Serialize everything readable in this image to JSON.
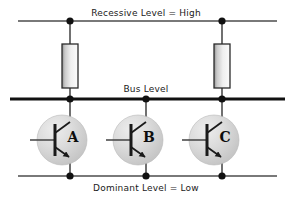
{
  "diagram": {
    "title_top": "Recessive Level = High",
    "title_middle": "Bus Level",
    "title_bottom": "Dominant Level = Low",
    "width": 293,
    "height": 203,
    "background": "#ffffff",
    "line_color": "#4d4d4d",
    "bus_line_color": "#111111",
    "node_color": "#111111",
    "component_stroke": "#222222",
    "resistor_fill_light": "#f4f4f4",
    "resistor_fill_dark": "#9a9a9a",
    "transistor_circle_fill": "#d6d6d6",
    "transistor_circle_highlight": "#eeeeee"
  },
  "rails": [
    {
      "name": "recessive-rail",
      "label": "Recessive Level = High",
      "y": 21,
      "x_start": 18,
      "x_end": 277,
      "thickness": 1.6,
      "label_x": 146,
      "label_y": 8,
      "nodes": [
        70,
        222
      ]
    },
    {
      "name": "bus-rail",
      "label": "Bus Level",
      "y": 99,
      "x_start": 10,
      "x_end": 285,
      "thickness": 3.2,
      "label_x": 146,
      "label_y": 84,
      "nodes": [
        70,
        146,
        222
      ]
    },
    {
      "name": "dominant-rail",
      "label": "Dominant Level = Low",
      "y": 176,
      "x_start": 18,
      "x_end": 277,
      "thickness": 1.6,
      "label_x": 146,
      "label_y": 183,
      "nodes": [
        70,
        146,
        222
      ]
    }
  ],
  "resistors": [
    {
      "name": "pull-up-resistor-left",
      "x": 70,
      "top": 44,
      "bottom": 88,
      "width": 16
    },
    {
      "name": "pull-up-resistor-right",
      "x": 222,
      "top": 44,
      "bottom": 88,
      "width": 16
    }
  ],
  "transistors": [
    {
      "name": "transistor-a",
      "label": "A",
      "cx": 62,
      "cy": 140,
      "r": 25,
      "collector_x": 70,
      "label_x": 73,
      "label_y": 137
    },
    {
      "name": "transistor-b",
      "label": "B",
      "cx": 138,
      "cy": 140,
      "r": 25,
      "collector_x": 146,
      "label_x": 149,
      "label_y": 137
    },
    {
      "name": "transistor-c",
      "label": "C",
      "cx": 214,
      "cy": 140,
      "r": 25,
      "collector_x": 222,
      "label_x": 225,
      "label_y": 137
    }
  ]
}
